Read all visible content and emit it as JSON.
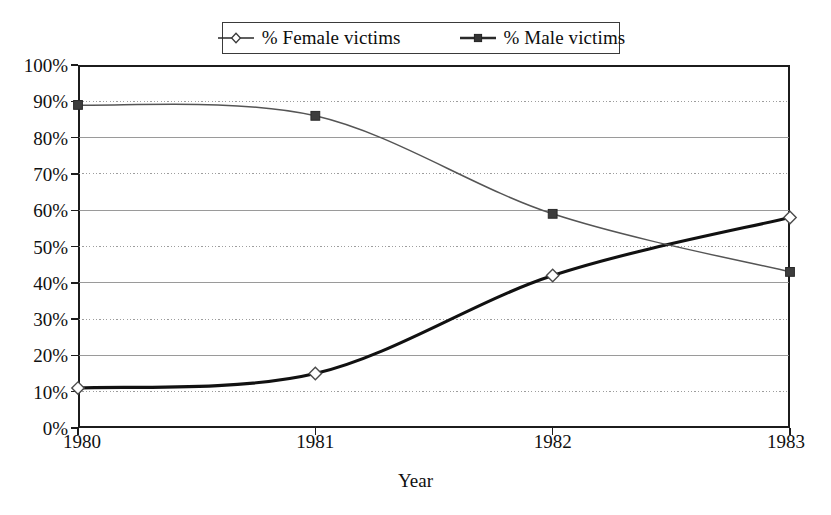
{
  "chart_data": {
    "type": "line",
    "title": "",
    "xlabel": "Year",
    "ylabel": "",
    "categories": [
      "1980",
      "1981",
      "1982",
      "1983"
    ],
    "x": [
      1980,
      1981,
      1982,
      1983
    ],
    "xlim": [
      1980,
      1983
    ],
    "ylim": [
      0,
      100
    ],
    "ytick_labels": [
      "0%",
      "10%",
      "20%",
      "30%",
      "40%",
      "50%",
      "60%",
      "70%",
      "80%",
      "90%",
      "100%"
    ],
    "ytick_values": [
      0,
      10,
      20,
      30,
      40,
      50,
      60,
      70,
      80,
      90,
      100
    ],
    "grid": "horizontal-dotted",
    "legend_position": "top-center",
    "smoothing": "spline",
    "series": [
      {
        "name": "% Female victims",
        "marker": "open-diamond",
        "line_style": "thick-solid",
        "color": "#111111",
        "values": [
          11,
          15,
          42,
          58
        ]
      },
      {
        "name": "% Male victims",
        "marker": "filled-square",
        "line_style": "thin-solid",
        "color": "#555555",
        "values": [
          89,
          86,
          59,
          43
        ]
      }
    ]
  },
  "legend": {
    "entries": [
      {
        "label": "% Female victims"
      },
      {
        "label": "% Male victims"
      }
    ]
  },
  "axes": {
    "x_title": "Year",
    "x_ticks": [
      "1980",
      "1981",
      "1982",
      "1983"
    ],
    "y_ticks": [
      "100%",
      "90%",
      "80%",
      "70%",
      "60%",
      "50%",
      "40%",
      "30%",
      "20%",
      "10%",
      "0%"
    ]
  },
  "colors": {
    "axis": "#1c1c1c",
    "grid": "#9a9a9a",
    "series_female": "#111111",
    "series_male": "#555555",
    "text": "#101010",
    "background": "#ffffff"
  }
}
